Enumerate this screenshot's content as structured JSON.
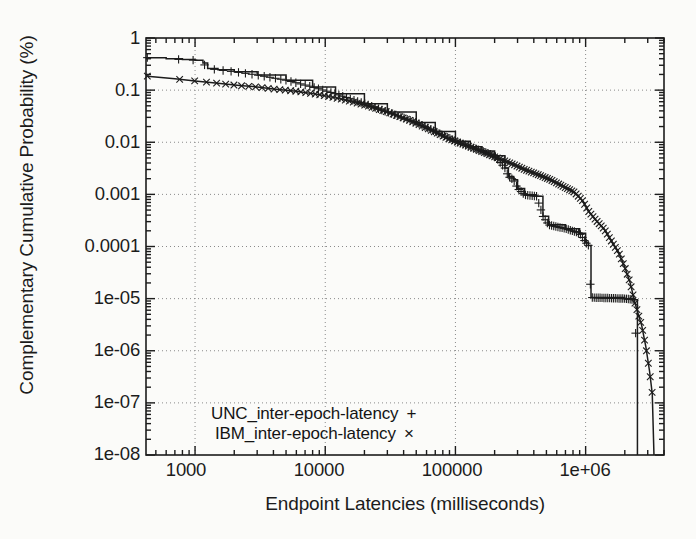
{
  "chart_data": {
    "type": "line",
    "title": "",
    "xlabel": "Endpoint Latencies (milliseconds)",
    "ylabel": "Complementary Cumulative Probability (%)",
    "xscale": "log",
    "yscale": "log",
    "xlim": [
      420,
      4000000
    ],
    "ylim": [
      1e-08,
      1
    ],
    "grid": true,
    "grid_style": "dotted",
    "legend_position": "inside-bottom-left",
    "xticks": [
      "1000",
      "10000",
      "100000",
      "1e+06"
    ],
    "xtick_values": [
      1000,
      10000,
      100000,
      1000000
    ],
    "yticks": [
      "1",
      "0.1",
      "0.01",
      "0.001",
      "0.0001",
      "1e-05",
      "1e-06",
      "1e-07",
      "1e-08"
    ],
    "ytick_values": [
      1,
      0.1,
      0.01,
      0.001,
      0.0001,
      1e-05,
      1e-06,
      1e-07,
      1e-08
    ],
    "series": [
      {
        "name": "UNC_inter-epoch-latency",
        "marker": "+",
        "marker_glyph": "+",
        "color": "#1c1c1c",
        "points": [
          [
            430,
            0.42
          ],
          [
            600,
            0.4
          ],
          [
            800,
            0.385
          ],
          [
            1000,
            0.375
          ],
          [
            1150,
            0.33
          ],
          [
            1250,
            0.26
          ],
          [
            1500,
            0.245
          ],
          [
            2000,
            0.225
          ],
          [
            3000,
            0.195
          ],
          [
            5000,
            0.155
          ],
          [
            8000,
            0.115
          ],
          [
            12000,
            0.085
          ],
          [
            20000,
            0.055
          ],
          [
            30000,
            0.038
          ],
          [
            50000,
            0.024
          ],
          [
            70000,
            0.016
          ],
          [
            100000,
            0.0105
          ],
          [
            130000,
            0.0082
          ],
          [
            160000,
            0.0068
          ],
          [
            200000,
            0.0055
          ],
          [
            240000,
            0.0032
          ],
          [
            255000,
            0.0022
          ],
          [
            280000,
            0.0019
          ],
          [
            300000,
            0.0013
          ],
          [
            340000,
            0.00098
          ],
          [
            420000,
            0.00092
          ],
          [
            470000,
            0.00038
          ],
          [
            520000,
            0.00026
          ],
          [
            700000,
            0.00022
          ],
          [
            900000,
            0.00018
          ],
          [
            1000000,
            0.00012
          ],
          [
            1050000,
            0.000105
          ],
          [
            1100000,
            1.05e-05
          ],
          [
            2000000,
            1e-05
          ],
          [
            2400000,
            9.5e-06
          ],
          [
            2500000,
            1e-08
          ]
        ]
      },
      {
        "name": "IBM_inter-epoch-latency",
        "marker": "x",
        "marker_glyph": "×",
        "color": "#1c1c1c",
        "points": [
          [
            430,
            0.185
          ],
          [
            700,
            0.165
          ],
          [
            1000,
            0.15
          ],
          [
            1500,
            0.135
          ],
          [
            2200,
            0.122
          ],
          [
            3000,
            0.115
          ],
          [
            4000,
            0.105
          ],
          [
            6000,
            0.095
          ],
          [
            9000,
            0.082
          ],
          [
            13000,
            0.068
          ],
          [
            20000,
            0.052
          ],
          [
            30000,
            0.038
          ],
          [
            45000,
            0.026
          ],
          [
            65000,
            0.017
          ],
          [
            90000,
            0.0115
          ],
          [
            120000,
            0.0088
          ],
          [
            160000,
            0.0066
          ],
          [
            210000,
            0.005
          ],
          [
            270000,
            0.0039
          ],
          [
            340000,
            0.003
          ],
          [
            430000,
            0.0024
          ],
          [
            540000,
            0.0019
          ],
          [
            680000,
            0.0014
          ],
          [
            820000,
            0.0011
          ],
          [
            950000,
            0.00075
          ],
          [
            1050000,
            0.00048
          ],
          [
            1200000,
            0.00032
          ],
          [
            1400000,
            0.00021
          ],
          [
            1600000,
            0.00012
          ],
          [
            1800000,
            7.5e-05
          ],
          [
            2000000,
            4e-05
          ],
          [
            2200000,
            2e-05
          ],
          [
            2400000,
            8e-06
          ],
          [
            2700000,
            3e-06
          ],
          [
            2900000,
            1.2e-06
          ],
          [
            3100000,
            4e-07
          ],
          [
            3250000,
            1.5e-07
          ],
          [
            3350000,
            1e-08
          ]
        ]
      }
    ]
  },
  "legend": {
    "rows": [
      {
        "label": "UNC_inter-epoch-latency",
        "mark": "+"
      },
      {
        "label": "IBM_inter-epoch-latency",
        "mark": "×"
      }
    ]
  },
  "axes": {
    "ylabel": "Complementary Cumulative Probability (%)",
    "xlabel": "Endpoint Latencies (milliseconds)",
    "ytick_labels": [
      "1",
      "0.1",
      "0.01",
      "0.001",
      "0.0001",
      "1e-05",
      "1e-06",
      "1e-07",
      "1e-08"
    ],
    "xtick_labels": [
      "1000",
      "10000",
      "100000",
      "1e+06"
    ]
  },
  "style": {
    "background": "#fbfbf9",
    "axis_color": "#1c1c1c",
    "grid_color": "#8a8a8a",
    "curve_color": "#1c1c1c"
  }
}
